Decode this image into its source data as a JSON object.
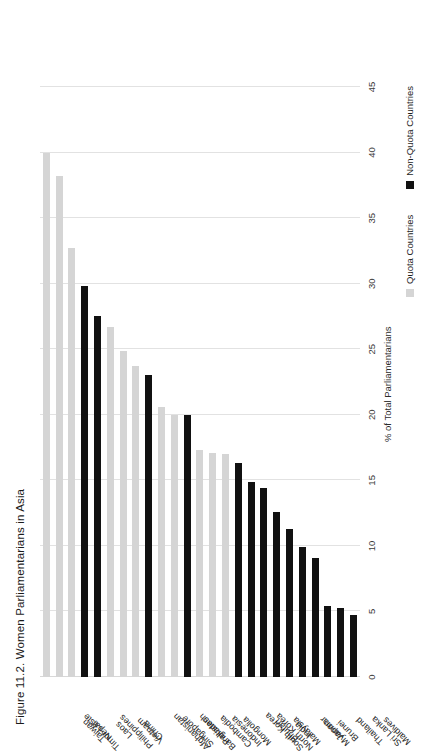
{
  "figure": {
    "title": "Figure 11.2. Women Parliamentarians in Asia"
  },
  "legend": {
    "position": "bottom-right",
    "items": [
      {
        "label": "Quota Countries",
        "color": "#d5d5d5",
        "swatch": "square-swatch-quota"
      },
      {
        "label": "Non-Quota Countries",
        "color": "#111111",
        "swatch": "square-swatch-nonquota"
      }
    ]
  },
  "chart_data": {
    "type": "bar",
    "orientation": "vertical-rotated",
    "title": "Figure 11.2. Women Parliamentarians in Asia",
    "xlabel": "",
    "ylabel": "% of Total Parliamentarians",
    "ylim": [
      0,
      45
    ],
    "yticks": [
      0,
      5,
      10,
      15,
      20,
      25,
      30,
      35,
      40,
      45
    ],
    "ytick_labels": [
      "0",
      "5",
      "10",
      "15",
      "20",
      "25",
      "30",
      "35",
      "40",
      "45"
    ],
    "grid": true,
    "categories": [
      "Maldives",
      "Sri Lanka",
      "Thailand",
      "Brunei",
      "Japan",
      "Myanmar",
      "India",
      "Malaysia",
      "Bhutan",
      "North Korea",
      "South Korea",
      "Mongolia",
      "Indonesia",
      "Cambodia",
      "Pakistan",
      "Bangladesh",
      "Singapore",
      "Afghanistan",
      "China",
      "Vietnam",
      "Laos",
      "Philippines",
      "Nepal",
      "Taiwan",
      "Timor-Leste"
    ],
    "values": [
      4.7,
      5.3,
      5.4,
      9.1,
      9.9,
      11.3,
      12.6,
      14.4,
      14.9,
      16.3,
      17.0,
      17.1,
      17.3,
      20.0,
      20.0,
      20.6,
      23.0,
      23.7,
      24.9,
      26.7,
      27.5,
      29.8,
      32.7,
      38.2,
      40.0
    ],
    "groups": [
      "Non-Quota Countries",
      "Non-Quota Countries",
      "Non-Quota Countries",
      "Non-Quota Countries",
      "Non-Quota Countries",
      "Non-Quota Countries",
      "Non-Quota Countries",
      "Non-Quota Countries",
      "Non-Quota Countries",
      "Non-Quota Countries",
      "Quota Countries",
      "Quota Countries",
      "Quota Countries",
      "Non-Quota Countries",
      "Quota Countries",
      "Quota Countries",
      "Non-Quota Countries",
      "Quota Countries",
      "Quota Countries",
      "Quota Countries",
      "Non-Quota Countries",
      "Non-Quota Countries",
      "Quota Countries",
      "Quota Countries",
      "Quota Countries"
    ],
    "colors": {
      "quota": "#d5d5d5",
      "nonquota": "#111111",
      "grid": "#e2e2e2"
    },
    "series": [
      {
        "name": "Quota Countries",
        "color": "#d5d5d5"
      },
      {
        "name": "Non-Quota Countries",
        "color": "#111111"
      }
    ]
  }
}
